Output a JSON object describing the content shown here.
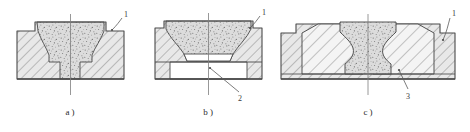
{
  "drawing": {
    "type": "engineering-cross-section",
    "description": "Three die cross-section views of forging/extrusion tooling",
    "line_color": "#4a4a4a",
    "hatch_color": "#5a5a5a",
    "die_fill": "#e6e6e6",
    "insert_fill": "#f2f2f2",
    "workpiece_fill": "#d8d8d8",
    "stipple_color": "#6b6b6b",
    "void_fill": "#ffffff",
    "centerline_color": "#7a7a7a"
  },
  "figures": [
    {
      "id": "a",
      "caption": "a )",
      "callouts": [
        {
          "id": "1",
          "label": "1"
        }
      ]
    },
    {
      "id": "b",
      "caption": "b )",
      "callouts": [
        {
          "id": "1",
          "label": "1"
        },
        {
          "id": "2",
          "label": "2"
        }
      ]
    },
    {
      "id": "c",
      "caption": "c )",
      "callouts": [
        {
          "id": "1",
          "label": "1"
        },
        {
          "id": "3",
          "label": "3"
        }
      ]
    }
  ]
}
